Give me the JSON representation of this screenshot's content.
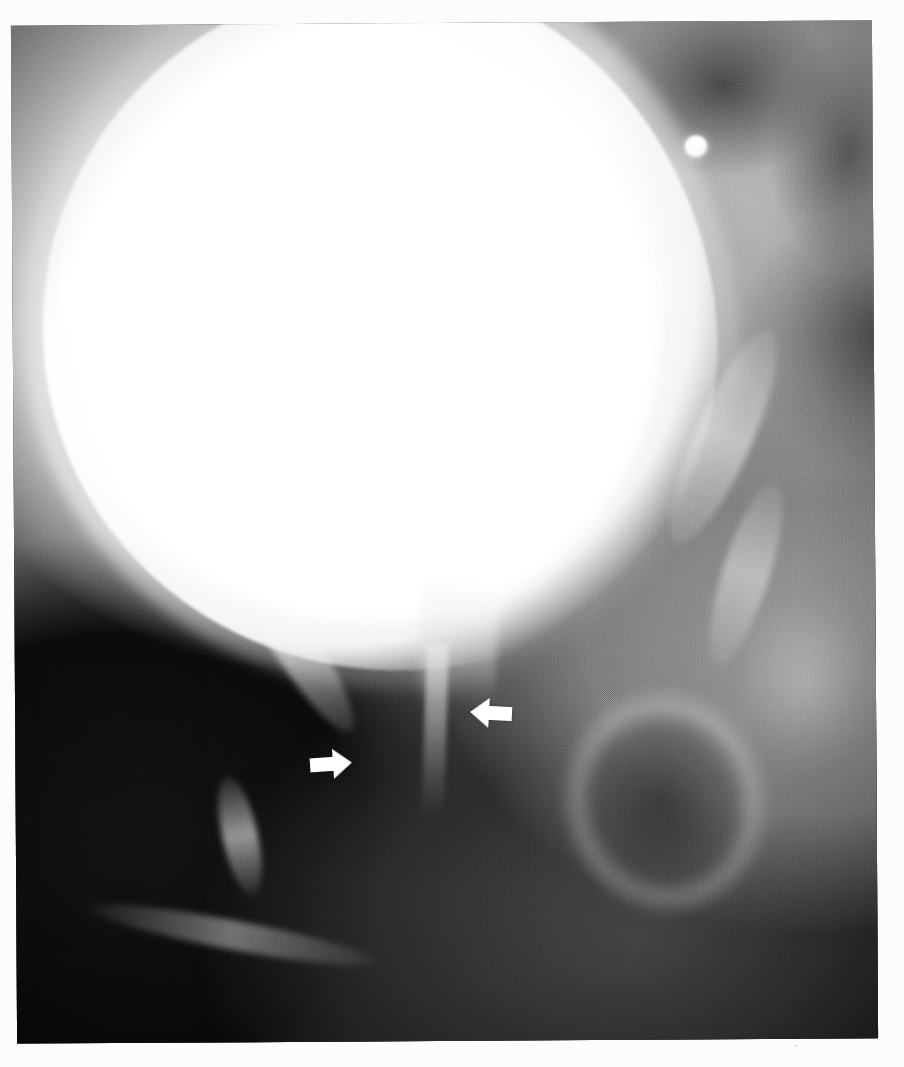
{
  "document": {
    "type": "radiograph",
    "modality": "Voiding cystourethrogram (VCUG) / cystogram",
    "view": "Anteroposterior oblique pelvis",
    "page_background": "#fcfcfa",
    "film_background": "#0b0b0b"
  },
  "radiograph": {
    "frame": {
      "left": 14,
      "top": 23,
      "width": 861,
      "height": 1018,
      "rotation_deg": -0.35
    },
    "structures": [
      {
        "id": "bladder",
        "label": "Contrast-filled urinary bladder",
        "density": "opaque-white",
        "color": "#ffffff"
      },
      {
        "id": "bladder-neck",
        "label": "Bladder base / neck funnel",
        "density": "high",
        "color": "#e8e8e8"
      },
      {
        "id": "urethra-column",
        "label": "Contrast column in proximal urethra",
        "density": "moderate",
        "color": "#cfcfcf"
      },
      {
        "id": "calcification",
        "label": "Small round calcific opacity (phlebolith)",
        "density": "opaque-white",
        "color": "#ffffff"
      },
      {
        "id": "ramus-left-upper",
        "label": "Left superior pubic ramus",
        "density": "bone",
        "color": "#eeeeee"
      },
      {
        "id": "ramus-left-lower",
        "label": "Left inferior pubic ramus",
        "density": "bone",
        "color": "#eeeeee"
      },
      {
        "id": "ramus-left-inner",
        "label": "Left ischiopubic ramus",
        "density": "bone",
        "color": "#ebebeb"
      },
      {
        "id": "ischium-left",
        "label": "Left ischial tuberosity",
        "density": "bone",
        "color": "#ececec"
      },
      {
        "id": "pubic-arch",
        "label": "Inferior pubic arch margin",
        "density": "bone",
        "color": "#d2d2d2"
      },
      {
        "id": "ramus-right-upper",
        "label": "Right superior pubic ramus",
        "density": "bone",
        "color": "#eeeeee"
      },
      {
        "id": "ramus-right-lower",
        "label": "Right inferior pubic ramus",
        "density": "bone",
        "color": "#ececec"
      },
      {
        "id": "obturator-right",
        "label": "Right obturator foramen",
        "density": "lucent-dark",
        "color": "#2a2a2a"
      },
      {
        "id": "femoral-head-right",
        "label": "Right femoral head / acetabulum",
        "density": "bone",
        "color": "#cccccc"
      },
      {
        "id": "dark-pocket-a",
        "label": "Bowel gas lucency",
        "density": "lucent-dark",
        "color": "#3c3c3c"
      },
      {
        "id": "dark-pocket-b",
        "label": "Bowel gas lucency",
        "density": "lucent-dark",
        "color": "#464646"
      },
      {
        "id": "dark-pocket-c",
        "label": "Soft tissue lucency",
        "density": "lucent-dark",
        "color": "#303030"
      }
    ],
    "annotations": [
      {
        "id": "arrow-left",
        "icon": "arrow-right-icon",
        "direction": "right",
        "color": "#ffffff",
        "x": 308,
        "y": 747,
        "width": 46,
        "height": 34,
        "points_at": "Left lateral margin of proximal urethra / bladder neck"
      },
      {
        "id": "arrow-right",
        "icon": "arrow-left-icon",
        "direction": "left",
        "color": "#ffffff",
        "x": 468,
        "y": 696,
        "width": 46,
        "height": 34,
        "points_at": "Right lateral margin of proximal urethra / bladder neck"
      }
    ]
  }
}
